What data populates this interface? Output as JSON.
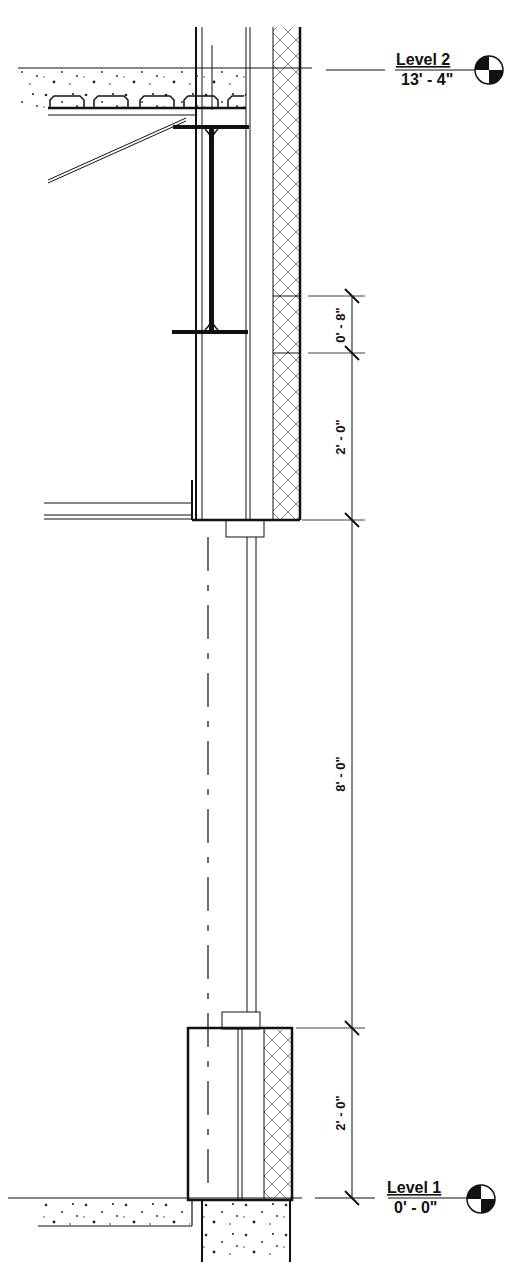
{
  "drawing": {
    "type": "wall section",
    "levels": [
      {
        "name": "Level 2",
        "elevation": "13' - 4\""
      },
      {
        "name": "Level 1",
        "elevation": "0' - 0\""
      }
    ],
    "dimensions": [
      {
        "id": "top_band",
        "value": "0' - 8\""
      },
      {
        "id": "upper_panel",
        "value": "2' - 0\""
      },
      {
        "id": "window_opening",
        "value": "8' - 0\""
      },
      {
        "id": "sill_panel",
        "value": "2' - 0\""
      }
    ],
    "components": [
      "concrete slab on metal deck",
      "steel beam (I-section)",
      "angle ledger",
      "insulation",
      "glazing",
      "concrete foundation"
    ],
    "colors": {
      "line": "#111111",
      "background": "#ffffff",
      "hatch": "#555555"
    }
  }
}
